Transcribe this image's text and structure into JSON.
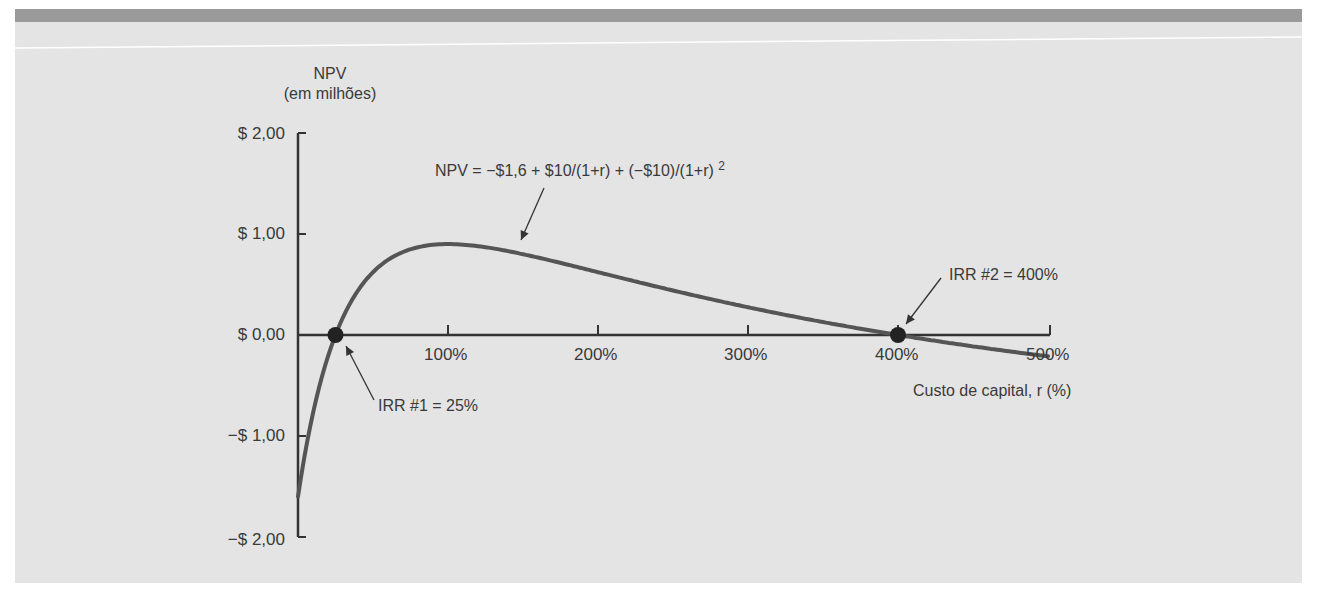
{
  "chart_data": {
    "type": "line",
    "title": "",
    "ylabel_line1": "NPV",
    "ylabel_line2": "(em milhões)",
    "xlabel": "Custo de capital, r (%)",
    "equation": "NPV = −$1,6 + $10/(1+r) + (−$10)/(1+r) ",
    "equation_exponent": "2",
    "ylim": [
      -2,
      2
    ],
    "xlim": [
      0,
      500
    ],
    "y_ticks": [
      {
        "value": 2,
        "label": "$ 2,00"
      },
      {
        "value": 1,
        "label": "$ 1,00"
      },
      {
        "value": 0,
        "label": "$ 0,00"
      },
      {
        "value": -1,
        "label": "−$ 1,00"
      },
      {
        "value": -2,
        "label": "−$ 2,00"
      }
    ],
    "x_ticks": [
      {
        "value": 100,
        "label": "100%"
      },
      {
        "value": 200,
        "label": "200%"
      },
      {
        "value": 300,
        "label": "300%"
      },
      {
        "value": 400,
        "label": "400%"
      },
      {
        "value": 500,
        "label": "500%"
      }
    ],
    "series": [
      {
        "name": "NPV",
        "x": [
          0,
          5,
          10,
          15,
          20,
          25,
          30,
          40,
          50,
          60,
          70,
          80,
          90,
          100,
          120,
          150,
          175,
          200,
          250,
          300,
          350,
          400,
          450,
          500
        ],
        "values": [
          -1.6,
          -1.174,
          -0.782,
          -0.421,
          -0.044,
          0.0,
          0.124,
          0.341,
          0.489,
          0.584,
          0.642,
          0.673,
          0.685,
          0.9,
          0.893,
          0.8,
          0.711,
          0.622,
          0.469,
          0.35,
          0.257,
          0.0,
          -0.102,
          -0.211
        ]
      }
    ],
    "annotations": [
      {
        "label": "IRR #1 = 25%",
        "x": 25,
        "y": 0
      },
      {
        "label": "IRR #2 = 400%",
        "x": 400,
        "y": 0
      }
    ],
    "grid": false,
    "legend": "none",
    "line_color": "#555555"
  }
}
